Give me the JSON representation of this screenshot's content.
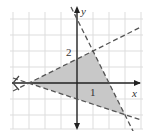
{
  "graph": {
    "axes": {
      "x_label": "x",
      "y_label": "y"
    },
    "tick_labels": {
      "y_tick": "2",
      "x_tick": "1"
    },
    "colors": {
      "shade": "#c8c8c8",
      "grid": "#dddddd",
      "axis": "#222222",
      "dash": "#555555"
    },
    "region_vertices": [
      [
        -3,
        0
      ],
      [
        1,
        2
      ],
      [
        3,
        -2
      ]
    ],
    "boundary_lines": [
      {
        "through": [
          [
            -3,
            0
          ],
          [
            1,
            2
          ]
        ],
        "style": "dashed"
      },
      {
        "through": [
          [
            1,
            2
          ],
          [
            3,
            -2
          ]
        ],
        "style": "dashed"
      },
      {
        "through": [
          [
            -3,
            0
          ],
          [
            3,
            -2
          ]
        ],
        "style": "dashed"
      }
    ]
  }
}
